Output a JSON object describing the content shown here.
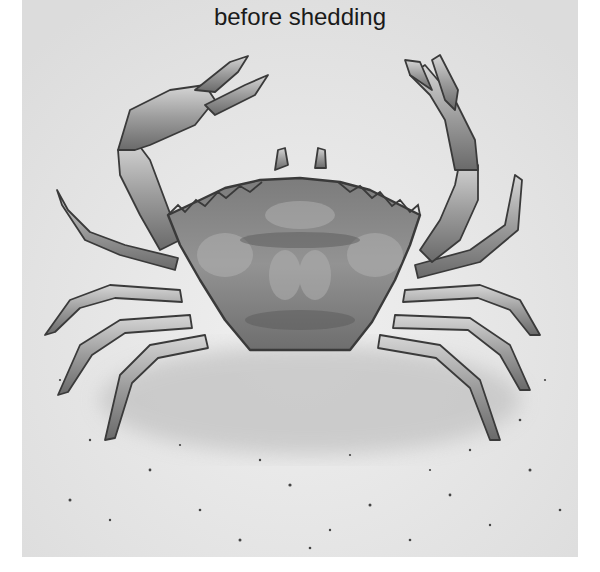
{
  "caption": "before shedding",
  "illustration": {
    "subject": "crab",
    "description": "Pencil-style grayscale illustration of a crab on speckled sand, claws raised",
    "colors": {
      "background_sand": "#e6e6e6",
      "shell": "#8a8a8a",
      "shell_dark": "#5a5a5a",
      "outline": "#3a3a3a",
      "leg_fill": "#b8b8b8"
    }
  }
}
